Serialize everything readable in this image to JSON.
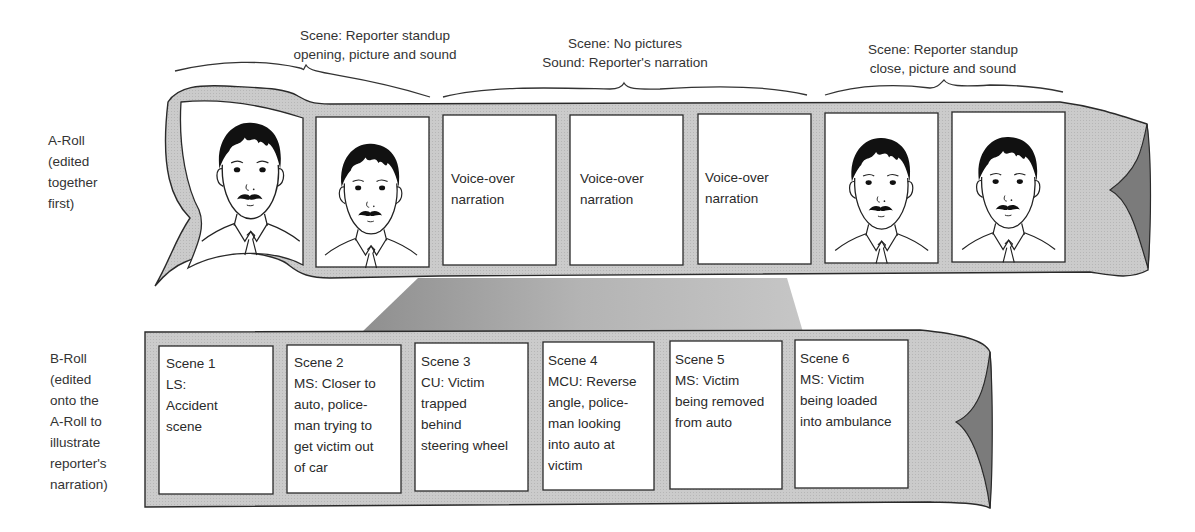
{
  "captions": [
    {
      "id": "opening",
      "lines": [
        "Scene: Reporter standup",
        "opening, picture and sound"
      ]
    },
    {
      "id": "middle",
      "lines": [
        "Scene: No pictures",
        "Sound: Reporter's narration"
      ]
    },
    {
      "id": "close",
      "lines": [
        "Scene: Reporter standup",
        "close, picture and sound"
      ]
    }
  ],
  "a_roll": {
    "label_lines": [
      "A-Roll",
      "(edited",
      "together",
      "first)"
    ],
    "frames": [
      {
        "type": "reporter-portrait"
      },
      {
        "type": "reporter-portrait"
      },
      {
        "type": "text",
        "lines": [
          "Voice-over",
          "narration"
        ]
      },
      {
        "type": "text",
        "lines": [
          "Voice-over",
          "narration"
        ]
      },
      {
        "type": "text",
        "lines": [
          "Voice-over",
          "narration"
        ]
      },
      {
        "type": "reporter-portrait"
      },
      {
        "type": "reporter-portrait"
      }
    ]
  },
  "b_roll": {
    "label_lines": [
      "B-Roll",
      "(edited",
      "onto the",
      "A-Roll to",
      "illustrate",
      "reporter's",
      "narration)"
    ],
    "frames": [
      {
        "lines": [
          "Scene 1",
          "LS:",
          "Accident",
          "scene"
        ]
      },
      {
        "lines": [
          "Scene 2",
          "MS: Closer to",
          "auto, police-",
          "man trying to",
          "get victim out",
          "of car"
        ]
      },
      {
        "lines": [
          "Scene 3",
          "CU: Victim",
          "trapped",
          "behind",
          "steering wheel"
        ]
      },
      {
        "lines": [
          "Scene 4",
          "MCU: Reverse",
          "angle, police-",
          "man looking",
          "into auto at",
          "victim"
        ]
      },
      {
        "lines": [
          "Scene 5",
          "MS: Victim",
          "being removed",
          "from auto"
        ]
      },
      {
        "lines": [
          "Scene 6",
          "MS: Victim",
          "being loaded",
          "into ambulance"
        ]
      }
    ]
  },
  "colors": {
    "tape_fill": "#c9c9c9",
    "tape_shadow": "#7a7a7a",
    "connector_fill": "#a8a8a8",
    "outline": "#2a2a2a",
    "frame_fill": "#ffffff"
  }
}
